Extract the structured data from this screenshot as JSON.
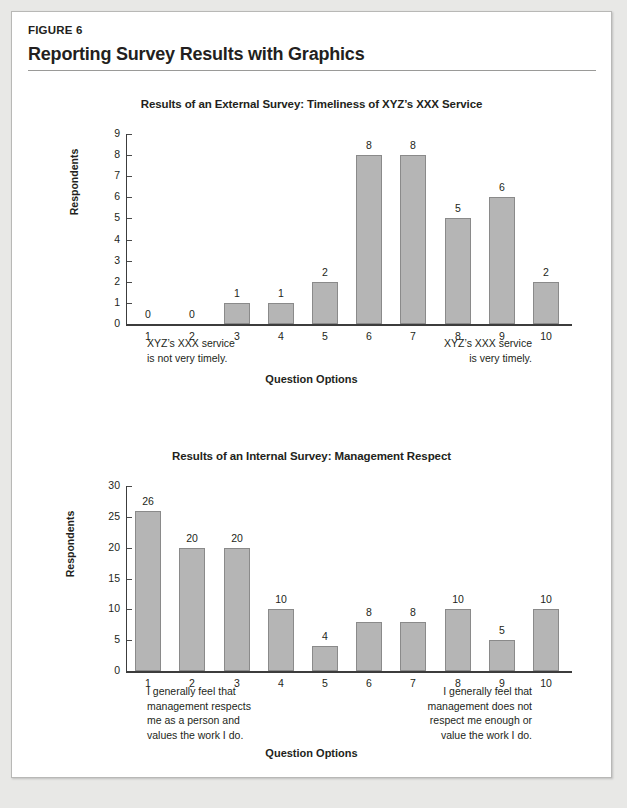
{
  "figure": {
    "kicker": "FIGURE 6",
    "title": "Reporting Survey Results with Graphics"
  },
  "colors": {
    "page_background": "#e8e8e6",
    "card_background": "#ffffff",
    "card_border": "#b8b8b6",
    "bar_fill": "#b5b5b5",
    "bar_stroke": "#8a8a8a",
    "axis": "#3c3c3c",
    "text": "#231f20"
  },
  "charts": [
    {
      "id": "external-survey",
      "title": "Results of an External Survey: Timeliness of XYZ’s XXX Service",
      "ylabel": "Respondents",
      "xlabel": "Question Options",
      "annotation_left": "XYZ’s XXX service\nis not very timely.",
      "annotation_right": "XYZ’s XXX service\nis very timely."
    },
    {
      "id": "internal-survey",
      "title": "Results of an Internal Survey: Management Respect",
      "ylabel": "Respondents",
      "xlabel": "Question Options",
      "annotation_left": "I generally feel that\nmanagement respects\nme as a person and\nvalues the work I do.",
      "annotation_right": "I generally feel that\nmanagement does not\nrespect me enough or\nvalue the work I do."
    }
  ],
  "chart_data": [
    {
      "type": "bar",
      "title": "Results of an External Survey: Timeliness of XYZ’s XXX Service",
      "xlabel": "Question Options",
      "ylabel": "Respondents",
      "categories": [
        "1",
        "2",
        "3",
        "4",
        "5",
        "6",
        "7",
        "8",
        "9",
        "10"
      ],
      "values": [
        0,
        0,
        1,
        1,
        2,
        8,
        8,
        5,
        6,
        2
      ],
      "ylim": [
        0,
        9
      ],
      "yticks": [
        0,
        1,
        2,
        3,
        4,
        5,
        6,
        7,
        8,
        9
      ],
      "grid": false,
      "legend": false,
      "data_labels": true,
      "annotations": [
        {
          "position": "below-axis-left",
          "text": "XYZ’s XXX service is not very timely."
        },
        {
          "position": "below-axis-right",
          "text": "XYZ’s XXX service is very timely."
        }
      ]
    },
    {
      "type": "bar",
      "title": "Results of an Internal Survey: Management Respect",
      "xlabel": "Question Options",
      "ylabel": "Respondents",
      "categories": [
        "1",
        "2",
        "3",
        "4",
        "5",
        "6",
        "7",
        "8",
        "9",
        "10"
      ],
      "values": [
        26,
        20,
        20,
        10,
        4,
        8,
        8,
        10,
        5,
        10
      ],
      "ylim": [
        0,
        30
      ],
      "yticks": [
        0,
        5,
        10,
        15,
        20,
        25,
        30
      ],
      "grid": false,
      "legend": false,
      "data_labels": true,
      "annotations": [
        {
          "position": "below-axis-left",
          "text": "I generally feel that management respects me as a person and values the work I do."
        },
        {
          "position": "below-axis-right",
          "text": "I generally feel that management does not respect me enough or value the work I do."
        }
      ]
    }
  ]
}
